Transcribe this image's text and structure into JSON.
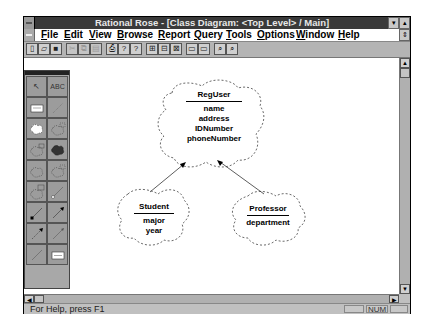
{
  "window": {
    "title": "Rational Rose - [Class Diagram: <Top Level> / Main]",
    "minimize_glyph": "▾",
    "maximize_glyph": "▴",
    "restore_glyph": "⇕"
  },
  "menu": {
    "items": [
      {
        "label": "File",
        "mnemonic": "F",
        "rest": "ile"
      },
      {
        "label": "Edit",
        "mnemonic": "E",
        "rest": "dit"
      },
      {
        "label": "View",
        "mnemonic": "V",
        "rest": "iew"
      },
      {
        "label": "Browse",
        "mnemonic": "B",
        "rest": "rowse"
      },
      {
        "label": "Report",
        "mnemonic": "R",
        "rest": "eport"
      },
      {
        "label": "Query",
        "mnemonic": "Q",
        "rest": "uery"
      },
      {
        "label": "Tools",
        "mnemonic": "T",
        "rest": "ools"
      },
      {
        "label": "Options",
        "mnemonic": "O",
        "rest": "ptions"
      },
      {
        "label": "Window",
        "mnemonic": "W",
        "rest": "indow"
      },
      {
        "label": "Help",
        "mnemonic": "H",
        "rest": "elp"
      }
    ]
  },
  "toolbar": {
    "buttons": [
      {
        "name": "new-icon",
        "glyph": "▯",
        "enabled": true
      },
      {
        "name": "open-icon",
        "glyph": "▱",
        "enabled": true
      },
      {
        "name": "save-icon",
        "glyph": "■",
        "enabled": true
      },
      {
        "name": "cut-icon",
        "glyph": "✂",
        "enabled": false
      },
      {
        "name": "copy-icon",
        "glyph": "⧉",
        "enabled": false
      },
      {
        "name": "paste-icon",
        "glyph": "▤",
        "enabled": false
      },
      {
        "name": "print-icon",
        "glyph": "⎙",
        "enabled": true
      },
      {
        "name": "help-icon",
        "glyph": "?",
        "enabled": true
      },
      {
        "name": "context-help-icon",
        "glyph": "?",
        "enabled": true
      },
      {
        "name": "browse-class-diagram-icon",
        "glyph": "⊞",
        "enabled": true
      },
      {
        "name": "browse-interaction-diagram-icon",
        "glyph": "⊟",
        "enabled": true
      },
      {
        "name": "browse-component-diagram-icon",
        "glyph": "⊠",
        "enabled": true
      },
      {
        "name": "browse-parent-icon",
        "glyph": "▭",
        "enabled": true
      },
      {
        "name": "browse-previous-icon",
        "glyph": "▭",
        "enabled": true
      },
      {
        "name": "zoom-in-icon",
        "glyph": "⌕",
        "enabled": true
      },
      {
        "name": "zoom-out-icon",
        "glyph": "⌕",
        "enabled": true
      }
    ]
  },
  "toolbox": {
    "tools": [
      {
        "name": "selection-tool",
        "label": "↖"
      },
      {
        "name": "text-tool",
        "label": "ABC"
      },
      {
        "name": "note-tool",
        "label": ""
      },
      {
        "name": "anchor-note-tool",
        "label": ""
      },
      {
        "name": "class-tool",
        "label": ""
      },
      {
        "name": "parameterized-class-tool",
        "label": ""
      },
      {
        "name": "instantiated-class-tool",
        "label": ""
      },
      {
        "name": "class-utility-tool",
        "label": ""
      },
      {
        "name": "parameterized-utility-tool",
        "label": ""
      },
      {
        "name": "instantiated-utility-tool",
        "label": ""
      },
      {
        "name": "metaclass-tool",
        "label": ""
      },
      {
        "name": "association-tool",
        "label": ""
      },
      {
        "name": "aggregation-tool",
        "label": ""
      },
      {
        "name": "uses-tool",
        "label": ""
      },
      {
        "name": "instantiates-tool",
        "label": ""
      },
      {
        "name": "inherits-tool",
        "label": ""
      },
      {
        "name": "dependency-tool",
        "label": ""
      },
      {
        "name": "category-tool",
        "label": ""
      }
    ]
  },
  "diagram": {
    "classes": [
      {
        "name": "RegUser",
        "attributes": [
          "name",
          "address",
          "IDNumber",
          "phoneNumber"
        ]
      },
      {
        "name": "Student",
        "attributes": [
          "major",
          "year"
        ]
      },
      {
        "name": "Professor",
        "attributes": [
          "department"
        ]
      }
    ],
    "relationships": [
      {
        "from": "Student",
        "to": "RegUser",
        "type": "inherits"
      },
      {
        "from": "Professor",
        "to": "RegUser",
        "type": "inherits"
      }
    ]
  },
  "statusbar": {
    "message": "For Help, press F1",
    "panels": [
      "",
      "NUM",
      ""
    ]
  }
}
